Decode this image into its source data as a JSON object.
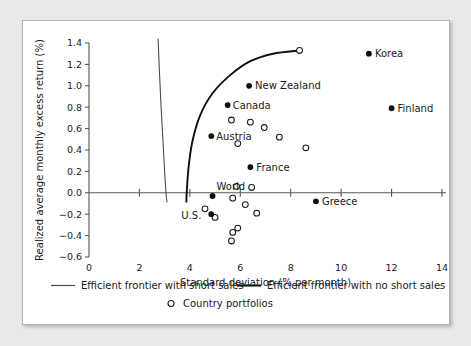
{
  "chart_data": {
    "type": "scatter",
    "title": "",
    "xlabel": "Standard deviation (% per month)",
    "ylabel": "Realized average monthly excess return (%)",
    "xlim": [
      0,
      14
    ],
    "ylim": [
      -0.6,
      1.4
    ],
    "xticks": [
      0,
      2,
      4,
      6,
      8,
      10,
      12,
      14
    ],
    "xtick_labels": [
      "0",
      "2",
      "4",
      "6",
      "8",
      "10",
      "12",
      "14"
    ],
    "yticks": [
      -0.6,
      -0.4,
      -0.2,
      0.0,
      0.2,
      0.4,
      0.6,
      0.8,
      1.0,
      1.2,
      1.4
    ],
    "ytick_labels": [
      "−0.6",
      "−0.4",
      "−0.2",
      "0.0",
      "0.2",
      "0.4",
      "0.6",
      "0.8",
      "1.0",
      "1.2",
      "1.4"
    ],
    "grid": false,
    "legend_position": "below-axis",
    "labeled_points": [
      {
        "name": "Korea",
        "x": 11.1,
        "y": 1.3,
        "label_dx": 6,
        "label_dy": 3.5
      },
      {
        "name": "Finland",
        "x": 12.0,
        "y": 0.79,
        "label_dx": 6,
        "label_dy": 3.5
      },
      {
        "name": "New Zealand",
        "x": 6.35,
        "y": 1.0,
        "label_dx": 6,
        "label_dy": 3.5
      },
      {
        "name": "Canada",
        "x": 5.5,
        "y": 0.82,
        "label_dx": 5,
        "label_dy": 3.5
      },
      {
        "name": "Austria",
        "x": 4.85,
        "y": 0.53,
        "label_dx": 5,
        "label_dy": 3.5
      },
      {
        "name": "France",
        "x": 6.4,
        "y": 0.24,
        "label_dx": 6,
        "label_dy": 3.5
      },
      {
        "name": "World",
        "x": 4.9,
        "y": -0.03,
        "label_dx": 4,
        "label_dy": -6
      },
      {
        "name": "U.S.",
        "x": 4.85,
        "y": -0.2,
        "label_dx": -30,
        "label_dy": 5
      },
      {
        "name": "Greece",
        "x": 9.0,
        "y": -0.08,
        "label_dx": 6,
        "label_dy": 3.5
      }
    ],
    "country_portfolios": [
      {
        "x": 8.35,
        "y": 1.33
      },
      {
        "x": 5.65,
        "y": 0.68
      },
      {
        "x": 6.4,
        "y": 0.66
      },
      {
        "x": 6.95,
        "y": 0.61
      },
      {
        "x": 7.55,
        "y": 0.52
      },
      {
        "x": 5.9,
        "y": 0.46
      },
      {
        "x": 8.6,
        "y": 0.42
      },
      {
        "x": 5.85,
        "y": 0.06
      },
      {
        "x": 6.45,
        "y": 0.05
      },
      {
        "x": 5.7,
        "y": -0.05
      },
      {
        "x": 6.2,
        "y": -0.11
      },
      {
        "x": 4.6,
        "y": -0.15
      },
      {
        "x": 6.65,
        "y": -0.19
      },
      {
        "x": 5.0,
        "y": -0.23
      },
      {
        "x": 5.9,
        "y": -0.33
      },
      {
        "x": 5.7,
        "y": -0.37
      },
      {
        "x": 5.65,
        "y": -0.45
      }
    ],
    "frontier_short_sales": [
      {
        "x": 2.74,
        "y": 1.44
      },
      {
        "x": 2.8,
        "y": 1.1
      },
      {
        "x": 2.86,
        "y": 0.8
      },
      {
        "x": 2.93,
        "y": 0.5
      },
      {
        "x": 3.0,
        "y": 0.2
      },
      {
        "x": 3.06,
        "y": -0.02
      },
      {
        "x": 3.1,
        "y": -0.09
      }
    ],
    "frontier_no_short_sales": [
      {
        "x": 8.35,
        "y": 1.33
      },
      {
        "x": 7.3,
        "y": 1.3
      },
      {
        "x": 6.4,
        "y": 1.23
      },
      {
        "x": 5.6,
        "y": 1.1
      },
      {
        "x": 4.9,
        "y": 0.93
      },
      {
        "x": 4.4,
        "y": 0.72
      },
      {
        "x": 4.1,
        "y": 0.48
      },
      {
        "x": 3.95,
        "y": 0.24
      },
      {
        "x": 3.88,
        "y": 0.02
      },
      {
        "x": 3.86,
        "y": -0.09
      }
    ]
  },
  "legend": {
    "items": [
      {
        "key": "frontier-short-sales",
        "label": "Efficient frontier with short sales",
        "symbol": "thin-line"
      },
      {
        "key": "frontier-no-short-sales",
        "label": "Efficient frontier with no short sales",
        "symbol": "thick-line"
      },
      {
        "key": "country-portfolios",
        "label": "Country portfolios",
        "symbol": "open-circle"
      }
    ]
  },
  "colors": {
    "axis": "#55575a",
    "frontier_short": "#4c4e52",
    "frontier_no_short": "#101010",
    "marker_filled": "#0d0d0d",
    "marker_open_stroke": "#1b1b1b",
    "panel_background": "#ffffff",
    "page_background": "#e9e9e9",
    "panel_border": "#b4b4b4"
  }
}
